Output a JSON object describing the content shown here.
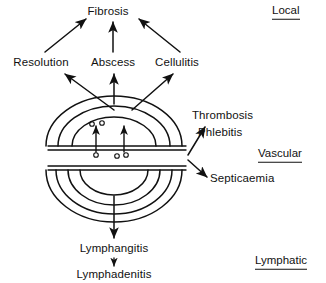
{
  "diagram": {
    "ink_color": "#111111",
    "background": "#ffffff",
    "nodes": {
      "fibrosis": "Fibrosis",
      "resolution": "Resolution",
      "abscess": "Abscess",
      "cellulitis": "Cellulitis",
      "thrombosis": "Thrombosis",
      "phlebitis": "Phlebitis",
      "septicaemia": "Septicaemia",
      "lymphangitis": "Lymphangitis",
      "lymphadenitis": "Lymphadenitis"
    },
    "sections": {
      "local": "Local",
      "vascular": "Vascular",
      "lymphatic": "Lymphatic"
    },
    "edges": [
      {
        "from": "focus",
        "to": "resolution"
      },
      {
        "from": "focus",
        "to": "abscess"
      },
      {
        "from": "focus",
        "to": "cellulitis"
      },
      {
        "from": "resolution",
        "to": "fibrosis"
      },
      {
        "from": "abscess",
        "to": "fibrosis"
      },
      {
        "from": "cellulitis",
        "to": "fibrosis"
      },
      {
        "from": "vessel",
        "to": "phlebitis"
      },
      {
        "from": "vessel",
        "to": "septicaemia"
      },
      {
        "from": "focus",
        "to": "lymphangitis"
      },
      {
        "from": "lymphangitis",
        "to": "lymphadenitis"
      }
    ],
    "focus": {
      "upper_arc_count": 3,
      "lower_arc_count": 4,
      "cell_count": 5,
      "diapedesis_arrow_count": 2,
      "vessel_count": 2
    }
  }
}
